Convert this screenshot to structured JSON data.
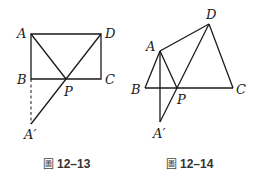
{
  "figures": [
    {
      "caption_prefix": "圖",
      "caption_number": "12–13",
      "labels": {
        "A": "A",
        "B": "B",
        "C": "C",
        "D": "D",
        "P": "P",
        "A_prime": "A′"
      }
    },
    {
      "caption_prefix": "圖",
      "caption_number": "12–14",
      "labels": {
        "A": "A",
        "B": "B",
        "C": "C",
        "D": "D",
        "P": "P",
        "A_prime": "A′"
      }
    }
  ],
  "colors": {
    "line": "#1a1a1a",
    "caption": "#333333"
  }
}
